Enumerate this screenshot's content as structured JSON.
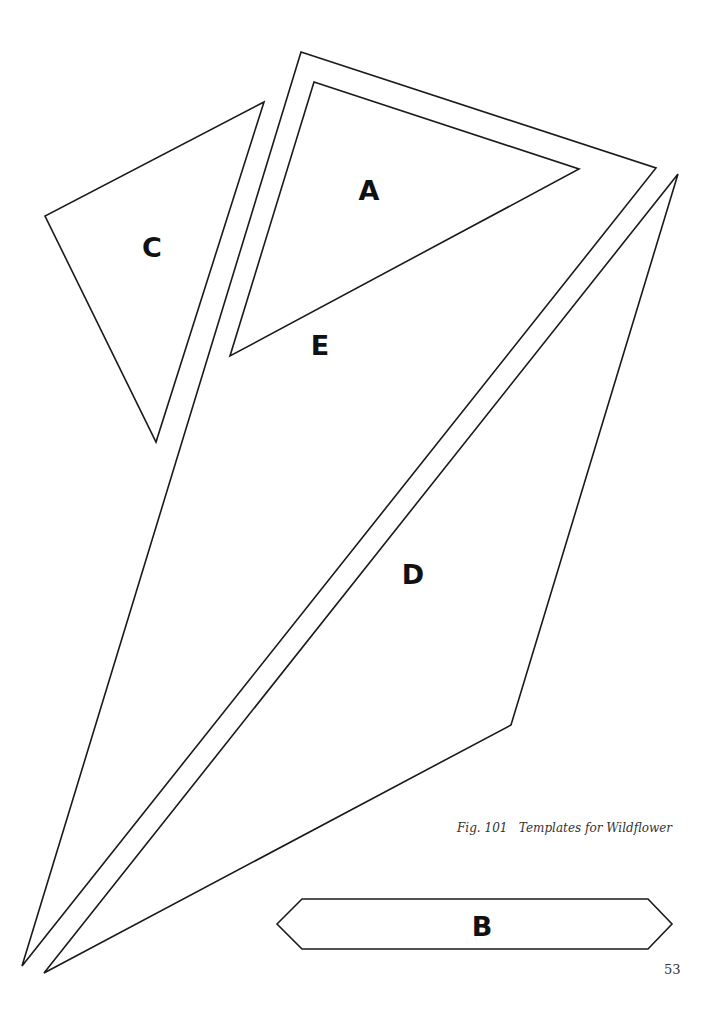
{
  "figure": {
    "caption": "Fig. 101   Templates for Wildflower",
    "page_number": "53"
  },
  "templates": [
    {
      "id": "A",
      "label": "A",
      "label_pos": [
        369,
        190
      ],
      "points": "314,82 579,169 230,356"
    },
    {
      "id": "B",
      "label": "B",
      "label_pos": [
        482,
        926
      ],
      "points": "277,924 302,899 648,899 672,924 648,949 302,949"
    },
    {
      "id": "C",
      "label": "C",
      "label_pos": [
        152,
        247
      ],
      "points": "264,102 45,216 156,442"
    },
    {
      "id": "D",
      "label": "D",
      "label_pos": [
        413,
        574
      ],
      "points": "678,174 511,725 44,973"
    },
    {
      "id": "E",
      "label": "E",
      "label_pos": [
        320,
        345
      ],
      "points": "301,52 656,168 22,966"
    }
  ],
  "colors": {
    "stroke": "#1a1a1a",
    "background": "#ffffff"
  }
}
